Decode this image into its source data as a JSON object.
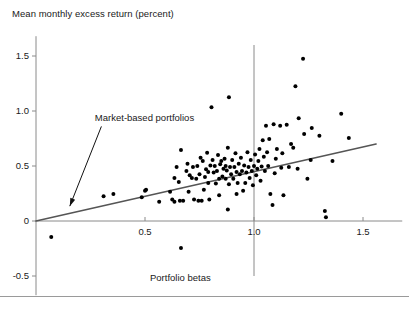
{
  "chart_data": {
    "type": "scatter",
    "title": "Mean monthly excess return (percent)",
    "xlabel": "Portfolio betas",
    "ylabel": "Mean monthly excess return (percent)",
    "xlim": [
      -0.05,
      1.68
    ],
    "ylim": [
      -0.62,
      1.68
    ],
    "xticks": [
      0.5,
      1.0,
      1.5
    ],
    "xtick_labels": [
      "0.5",
      "1.0",
      "1.5"
    ],
    "yticks": [
      -0.5,
      0,
      0.5,
      1.0,
      1.5
    ],
    "ytick_labels": [
      "-0.5",
      "0",
      "0.5",
      "1.0",
      "1.5"
    ],
    "grid": false,
    "legend": null,
    "annotations": [
      {
        "text": "Market-based portfolios",
        "text_x": 0.27,
        "text_y": 0.93,
        "arrow_from_x": 0.3,
        "arrow_from_y": 0.86,
        "arrow_to_x": 0.155,
        "arrow_to_y": 0.135
      }
    ],
    "reference_lines": [
      {
        "name": "beta-one-vertical",
        "orientation": "vertical",
        "value": 1.0,
        "y_from": -0.5,
        "y_to": 1.6
      }
    ],
    "fit_line": {
      "name": "security-market-line",
      "x_from": 0.0,
      "y_from": 0.0,
      "x_to": 1.56,
      "y_to": 0.7,
      "slope": 0.449,
      "intercept": 0.0,
      "color": "#555555"
    },
    "marker_color": "#000000",
    "marker_size": 2.6,
    "points": [
      [
        0.07,
        -0.145
      ],
      [
        0.31,
        0.225
      ],
      [
        0.355,
        0.245
      ],
      [
        0.485,
        0.215
      ],
      [
        0.5,
        0.275
      ],
      [
        0.505,
        0.285
      ],
      [
        0.565,
        0.175
      ],
      [
        0.615,
        0.265
      ],
      [
        0.625,
        0.195
      ],
      [
        0.635,
        0.175
      ],
      [
        0.635,
        0.39
      ],
      [
        0.645,
        0.49
      ],
      [
        0.655,
        0.355
      ],
      [
        0.66,
        0.185
      ],
      [
        0.665,
        0.645
      ],
      [
        0.665,
        -0.245
      ],
      [
        0.675,
        0.185
      ],
      [
        0.69,
        0.455
      ],
      [
        0.695,
        0.52
      ],
      [
        0.7,
        0.265
      ],
      [
        0.705,
        0.415
      ],
      [
        0.715,
        0.39
      ],
      [
        0.72,
        0.49
      ],
      [
        0.725,
        0.195
      ],
      [
        0.735,
        0.385
      ],
      [
        0.74,
        0.5
      ],
      [
        0.745,
        0.185
      ],
      [
        0.75,
        0.425
      ],
      [
        0.755,
        0.575
      ],
      [
        0.76,
        0.185
      ],
      [
        0.765,
        0.545
      ],
      [
        0.775,
        0.4
      ],
      [
        0.78,
        0.47
      ],
      [
        0.785,
        0.62
      ],
      [
        0.79,
        0.345
      ],
      [
        0.795,
        0.195
      ],
      [
        0.8,
        0.505
      ],
      [
        0.805,
        1.035
      ],
      [
        0.81,
        0.555
      ],
      [
        0.815,
        0.44
      ],
      [
        0.82,
        0.5
      ],
      [
        0.825,
        0.34
      ],
      [
        0.83,
        0.455
      ],
      [
        0.835,
        0.6
      ],
      [
        0.84,
        0.385
      ],
      [
        0.845,
        0.515
      ],
      [
        0.85,
        0.545
      ],
      [
        0.855,
        0.405
      ],
      [
        0.86,
        0.475
      ],
      [
        0.865,
        0.565
      ],
      [
        0.87,
        0.385
      ],
      [
        0.875,
        0.46
      ],
      [
        0.88,
        0.665
      ],
      [
        0.885,
        0.335
      ],
      [
        0.885,
        1.125
      ],
      [
        0.89,
        0.49
      ],
      [
        0.895,
        0.425
      ],
      [
        0.9,
        0.555
      ],
      [
        0.905,
        0.385
      ],
      [
        0.91,
        0.49
      ],
      [
        0.915,
        0.615
      ],
      [
        0.92,
        0.445
      ],
      [
        0.925,
        0.345
      ],
      [
        0.93,
        0.52
      ],
      [
        0.935,
        0.425
      ],
      [
        0.94,
        0.575
      ],
      [
        0.945,
        0.455
      ],
      [
        0.95,
        0.275
      ],
      [
        0.955,
        0.505
      ],
      [
        0.96,
        0.345
      ],
      [
        0.965,
        0.44
      ],
      [
        0.97,
        0.625
      ],
      [
        0.975,
        0.49
      ],
      [
        0.98,
        0.39
      ],
      [
        0.985,
        0.555
      ],
      [
        0.99,
        0.455
      ],
      [
        0.995,
        0.325
      ],
      [
        1.0,
        0.5
      ],
      [
        1.005,
        0.605
      ],
      [
        1.01,
        0.415
      ],
      [
        1.015,
        0.475
      ],
      [
        1.02,
        0.545
      ],
      [
        1.025,
        0.655
      ],
      [
        1.03,
        0.365
      ],
      [
        1.035,
        0.495
      ],
      [
        1.04,
        0.735
      ],
      [
        1.045,
        0.585
      ],
      [
        1.05,
        0.455
      ],
      [
        1.055,
        0.865
      ],
      [
        1.06,
        0.625
      ],
      [
        1.065,
        0.5
      ],
      [
        1.07,
        0.745
      ],
      [
        1.075,
        0.245
      ],
      [
        1.085,
        0.145
      ],
      [
        1.09,
        0.88
      ],
      [
        1.095,
        0.435
      ],
      [
        1.1,
        0.565
      ],
      [
        1.105,
        0.655
      ],
      [
        1.12,
        0.865
      ],
      [
        1.125,
        0.485
      ],
      [
        1.13,
        0.615
      ],
      [
        1.135,
        0.235
      ],
      [
        1.15,
        0.875
      ],
      [
        1.16,
        0.49
      ],
      [
        1.17,
        0.7
      ],
      [
        1.18,
        0.665
      ],
      [
        1.19,
        1.225
      ],
      [
        1.2,
        0.475
      ],
      [
        1.205,
        0.935
      ],
      [
        1.225,
        1.475
      ],
      [
        1.23,
        0.79
      ],
      [
        1.245,
        0.385
      ],
      [
        1.26,
        0.555
      ],
      [
        1.265,
        0.845
      ],
      [
        1.3,
        0.775
      ],
      [
        1.325,
        0.09
      ],
      [
        1.33,
        0.035
      ],
      [
        1.36,
        0.545
      ],
      [
        1.4,
        0.975
      ],
      [
        1.435,
        0.755
      ],
      [
        0.88,
        0.105
      ],
      [
        0.77,
        0.285
      ],
      [
        0.92,
        0.245
      ],
      [
        0.84,
        0.235
      ],
      [
        0.79,
        0.445
      ],
      [
        0.87,
        0.5
      ]
    ]
  },
  "footer": {
    "rule_visible": true
  }
}
